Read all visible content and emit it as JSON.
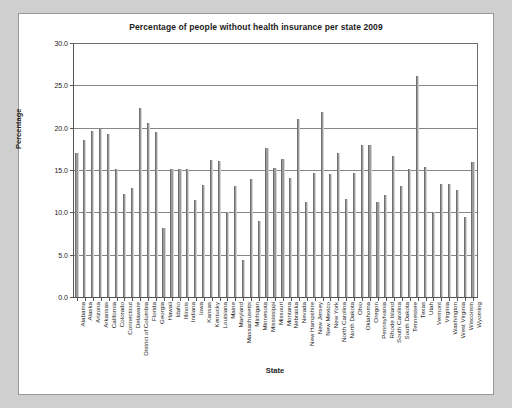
{
  "chart_data": {
    "type": "bar",
    "title": "Percentage of people without health insurance per state 2009",
    "xlabel": "State",
    "ylabel": "Percentage",
    "ylim": [
      0.0,
      30.0
    ],
    "yticks": [
      "0.0",
      "5.0",
      "10.0",
      "15.0",
      "20.0",
      "25.0",
      "30.0"
    ],
    "ytick_values": [
      0.0,
      5.0,
      10.0,
      15.0,
      20.0,
      25.0,
      30.0
    ],
    "grid": true,
    "legend": "none",
    "bar_color": "#9b9b9b",
    "categories": [
      "Alabama",
      "Alaska",
      "Arizona",
      "Arkansas",
      "California",
      "Colorado",
      "Connecticut",
      "Delaware",
      "District of Columbia",
      "Florida",
      "Georgia",
      "Hawaii",
      "Idaho",
      "Illinois",
      "Indiana",
      "Iowa",
      "Kansas",
      "Kentucky",
      "Louisiana",
      "Maine",
      "Maryland",
      "Massachusetts",
      "Michigan",
      "Minnesota",
      "Mississippi",
      "Missouri",
      "Montana",
      "Nebraska",
      "Nevada",
      "New Hampshire",
      "New Jersey",
      "New Mexico",
      "New York",
      "North Carolina",
      "North Dakota",
      "Ohio",
      "Oklahoma",
      "Oregon",
      "Pennsylvania",
      "Rhode Island",
      "South Carolina",
      "South Dakota",
      "Tennessee",
      "Texas",
      "Utah",
      "Vermont",
      "Virginia",
      "Washington",
      "West Virginia",
      "Wisconsin",
      "Wyoming"
    ],
    "values": [
      17.0,
      18.5,
      19.6,
      19.8,
      19.3,
      15.1,
      12.2,
      12.9,
      22.3,
      20.5,
      19.5,
      8.2,
      15.1,
      15.1,
      15.1,
      11.4,
      13.2,
      16.2,
      16.1,
      10.1,
      13.1,
      4.4,
      13.9,
      9.0,
      17.6,
      15.2,
      16.3,
      14.1,
      21.0,
      11.2,
      14.6,
      21.8,
      14.5,
      17.0,
      11.6,
      14.6,
      18.0,
      17.9,
      11.2,
      12.1,
      16.7,
      13.1,
      15.1,
      26.1,
      15.3,
      10.1,
      13.4,
      13.3,
      12.6,
      9.5,
      15.9
    ]
  }
}
